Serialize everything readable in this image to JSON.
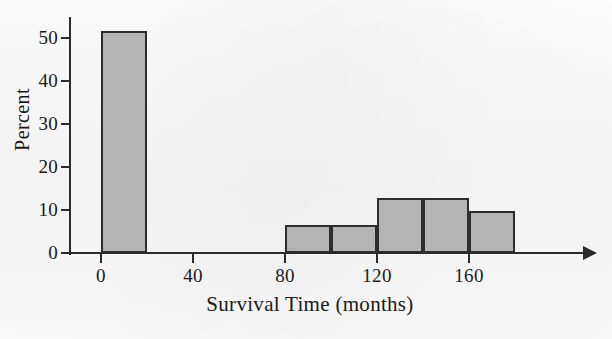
{
  "chart_data": {
    "type": "bar",
    "title": "",
    "subtitle": "",
    "xlabel": "Survival Time (months)",
    "ylabel": "Percent",
    "grid": false,
    "legend": null,
    "xlim": [
      -10,
      210
    ],
    "ylim": [
      0,
      55
    ],
    "xticks": [
      0,
      40,
      80,
      120,
      160
    ],
    "yticks": [
      0,
      10,
      20,
      30,
      40,
      50
    ],
    "xtick_labels": [
      "0",
      "40",
      "80",
      "120",
      "160"
    ],
    "ytick_labels": [
      "0",
      "10",
      "20",
      "30",
      "40",
      "50"
    ],
    "bin_width": 20,
    "bars": [
      {
        "bin_start": 0,
        "bin_end": 20,
        "value": 51.6
      },
      {
        "bin_start": 80,
        "bin_end": 100,
        "value": 6.5
      },
      {
        "bin_start": 100,
        "bin_end": 120,
        "value": 6.5
      },
      {
        "bin_start": 120,
        "bin_end": 140,
        "value": 12.9
      },
      {
        "bin_start": 140,
        "bin_end": 160,
        "value": 12.9
      },
      {
        "bin_start": 160,
        "bin_end": 180,
        "value": 9.7
      }
    ],
    "categories": [
      "0-20",
      "80-100",
      "100-120",
      "120-140",
      "140-160",
      "160-180"
    ],
    "values": [
      51.6,
      6.5,
      6.5,
      12.9,
      12.9,
      9.7
    ],
    "colors": {
      "bar_fill": "#b4b4b4",
      "bar_edge": "#2d2d2d",
      "axis": "#2b2b2b",
      "text": "#1a1a1a",
      "background": "#fdfdfd"
    },
    "x_axis_arrow": true
  }
}
